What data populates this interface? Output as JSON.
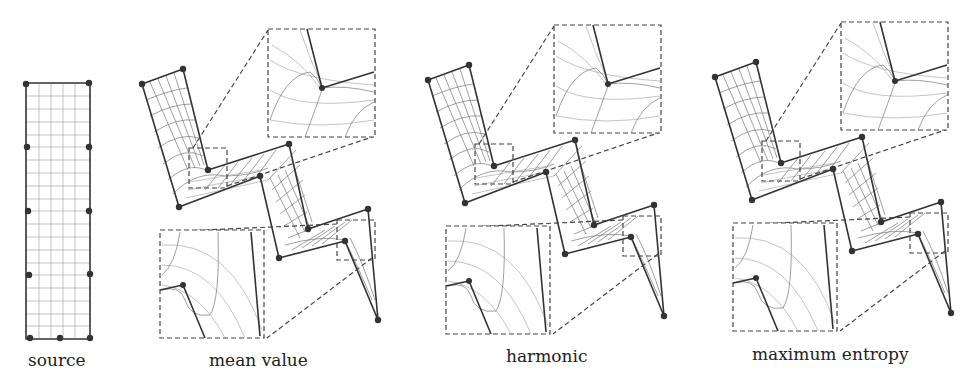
{
  "figure": {
    "panels": [
      {
        "id": "source",
        "label": "source"
      },
      {
        "id": "mean-value",
        "label": "mean value"
      },
      {
        "id": "harmonic",
        "label": "harmonic"
      },
      {
        "id": "maximum-entropy",
        "label": "maximum entropy"
      }
    ],
    "source_grid": {
      "columns": 6,
      "rows": 20,
      "control_points": 11
    },
    "deformed_cage": {
      "vertices": 11,
      "zoom_insets_per_panel": 2
    },
    "colors": {
      "outline": "#333333",
      "grid": "#777777",
      "grid_light": "#aaaaaa",
      "background": "#ffffff"
    }
  }
}
